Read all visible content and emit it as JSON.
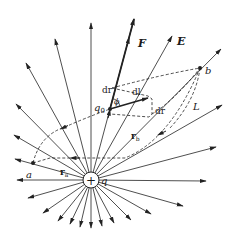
{
  "figure": {
    "colors": {
      "line": "#222222",
      "background": "#ffffff"
    },
    "charge": {
      "symbol": "+",
      "label": "q",
      "center": [
        91,
        180
      ],
      "radius": 8
    },
    "field_lines": {
      "tips": [
        [
          91,
          23
        ],
        [
          55,
          39
        ],
        [
          26,
          63
        ],
        [
          16,
          104
        ],
        [
          14,
          135
        ],
        [
          15,
          159
        ],
        [
          17,
          180
        ],
        [
          28,
          198
        ],
        [
          43,
          213
        ],
        [
          58,
          221
        ],
        [
          70,
          224
        ],
        [
          80,
          227
        ],
        [
          91,
          228
        ],
        [
          102,
          226
        ],
        [
          114,
          223
        ],
        [
          131,
          220
        ],
        [
          151,
          214
        ],
        [
          183,
          206
        ],
        [
          206,
          181
        ],
        [
          216,
          147
        ],
        [
          222,
          105
        ],
        [
          221,
          49
        ],
        [
          172,
          36
        ],
        [
          134,
          19
        ]
      ]
    },
    "labels": {
      "F": "F",
      "E": "E",
      "b": "b",
      "a": "a",
      "q0_main": "q",
      "q0_sub": "0",
      "dr_top": "dr",
      "dl": "dl",
      "phi": "ϕ",
      "dr_side": "dr",
      "L": "L",
      "rb_main": "r",
      "rb_sub": "b",
      "ra_main": "r",
      "ra_sub": "a",
      "q": "q",
      "plus": "+"
    },
    "points": {
      "a": [
        33,
        163
      ],
      "b": [
        200,
        68
      ],
      "q0": [
        110,
        109
      ]
    }
  }
}
